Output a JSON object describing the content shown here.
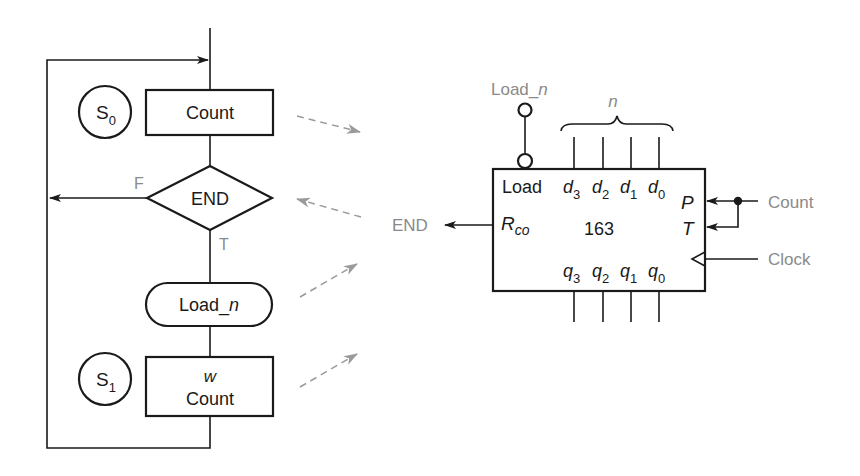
{
  "flowchart": {
    "states": [
      {
        "label": "S",
        "sub": "0"
      },
      {
        "label": "S",
        "sub": "1"
      }
    ],
    "count_box": {
      "label": "Count"
    },
    "decision": {
      "label": "END",
      "false_label": "F",
      "true_label": "T"
    },
    "conditional_output": {
      "prefix": "Load_",
      "var": "n"
    },
    "s1_box": {
      "line1": "w",
      "line2": "Count"
    }
  },
  "counter": {
    "part_number": "163",
    "load_signal": {
      "prefix": "Load_",
      "var": "n"
    },
    "bus_label": "n",
    "load_pin": "Load",
    "data_inputs": [
      {
        "base": "d",
        "sub": "3"
      },
      {
        "base": "d",
        "sub": "2"
      },
      {
        "base": "d",
        "sub": "1"
      },
      {
        "base": "d",
        "sub": "0"
      }
    ],
    "outputs": [
      {
        "base": "q",
        "sub": "3"
      },
      {
        "base": "q",
        "sub": "2"
      },
      {
        "base": "q",
        "sub": "1"
      },
      {
        "base": "q",
        "sub": "0"
      }
    ],
    "rco": {
      "base": "R",
      "sub": "co"
    },
    "enable_p": "P",
    "enable_t": "T",
    "external": {
      "end": "END",
      "count": "Count",
      "clock": "Clock"
    }
  },
  "colors": {
    "line": "#1a1a1a",
    "signal_text": "#8a8a8a",
    "dashed_arrow": "#9a9a9a"
  }
}
